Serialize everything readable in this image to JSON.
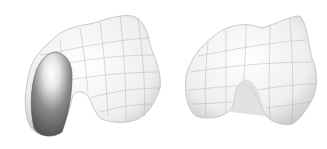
{
  "figure": {
    "panels": [
      {
        "name": "femoral-model-with-implant",
        "description": "3D wireframe-shaded distal femur with dark condyle component"
      },
      {
        "name": "femoral-model-plain",
        "description": "3D wireframe-shaded distal femur"
      }
    ],
    "colors": {
      "background": "#ffffff",
      "surface": "#f2f2f2",
      "mesh": "#9a9a9a",
      "shadow": "#cfcfcf",
      "implant_dark": "#6e6e6e",
      "implant_light": "#ffffff"
    }
  }
}
